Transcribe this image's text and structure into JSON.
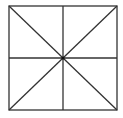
{
  "diagram": {
    "type": "square-with-diagonals-and-midlines",
    "stroke_color": "#333333",
    "background": "#ffffff",
    "square": {
      "x1": 9,
      "y1": 6,
      "x2": 117,
      "y2": 110
    },
    "center": {
      "x": 63,
      "y": 58
    }
  }
}
